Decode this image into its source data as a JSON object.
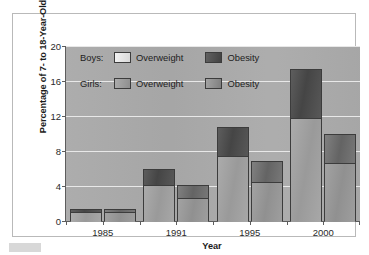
{
  "chart_data": {
    "type": "bar",
    "subtype": "stacked-grouped",
    "title": "",
    "xlabel": "Year",
    "ylabel": "Percentage of 7- to 18-Year-Olds",
    "categories": [
      "1985",
      "1991",
      "1995",
      "2000"
    ],
    "ylim": [
      0,
      20
    ],
    "yticks": [
      0,
      4,
      8,
      12,
      16,
      20
    ],
    "ytick_labels": [
      "0",
      "4",
      "8",
      "12",
      "16",
      "20"
    ],
    "grid": true,
    "grid_axis": "y",
    "legend_position": "inside-top-left",
    "groups": [
      {
        "name": "Boys",
        "label": "Boys:",
        "series": [
          {
            "name": "Overweight",
            "label": "Overweight",
            "color": "#a2a2a2",
            "values": [
              1.2,
              4.2,
              7.6,
              11.9
            ]
          },
          {
            "name": "Obesity",
            "label": "Obesity",
            "color": "#4b4b4b",
            "values": [
              0.2,
              1.7,
              3.1,
              5.5
            ]
          }
        ],
        "totals": [
          1.4,
          5.9,
          10.7,
          17.4
        ]
      },
      {
        "name": "Girls",
        "label": "Girls:",
        "series": [
          {
            "name": "Overweight",
            "label": "Overweight",
            "color": "#989898",
            "values": [
              1.2,
              2.7,
              4.6,
              6.8
            ]
          },
          {
            "name": "Obesity",
            "label": "Obesity",
            "color": "#6f6f6f",
            "values": [
              0.2,
              1.4,
              2.3,
              3.1
            ]
          }
        ],
        "totals": [
          1.4,
          4.1,
          6.9,
          9.9
        ]
      }
    ]
  },
  "axes": {
    "y_title": "Percentage of 7- to 18-Year-Olds",
    "x_title": "Year"
  },
  "legend": {
    "boys": {
      "group_label": "Boys:",
      "overweight_label": "Overweight",
      "obesity_label": "Obesity"
    },
    "girls": {
      "group_label": "Girls:",
      "overweight_label": "Overweight",
      "obesity_label": "Obesity"
    }
  },
  "colors": {
    "plot_background": "#a9a9a9",
    "gridline": "#e8e8e8",
    "axis_line": "#5d5d5d",
    "bar_outline": "#3c3c3c",
    "figure_background": "#ffffff",
    "frame_border": "#b9b9b9"
  }
}
